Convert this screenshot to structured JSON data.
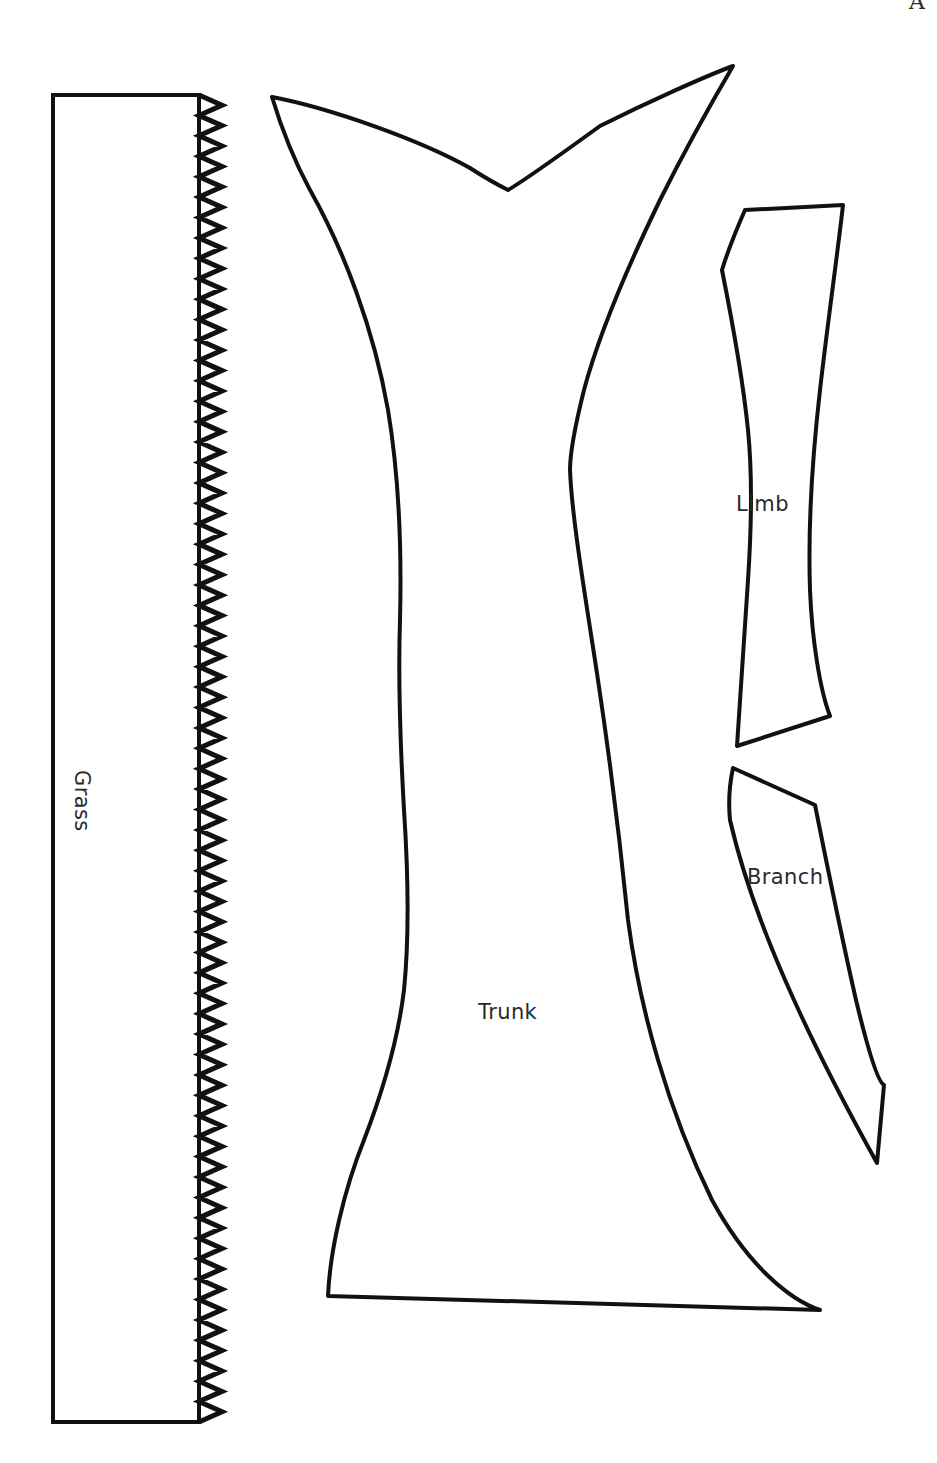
{
  "page": {
    "width": 937,
    "height": 1463,
    "background_color": "#ffffff",
    "ink_color": "#111111",
    "corner_letter": "A"
  },
  "document": {
    "kind": "pattern-template-sheet",
    "subject": "tree",
    "line_color": "#111111",
    "fill": "none"
  },
  "pieces": [
    {
      "id": "grass",
      "label": "Grass",
      "label_rotation_deg": 90,
      "description": "tall narrow rectangle with sawtooth zigzag along its right edge",
      "bbox": [
        53,
        95,
        222,
        1422
      ]
    },
    {
      "id": "trunk",
      "label": "Trunk",
      "label_rotation_deg": 0,
      "description": "wide tapering trunk with a V crotch at the top and a flared base",
      "bbox": [
        272,
        66,
        822,
        1312
      ]
    },
    {
      "id": "limb",
      "label": "Limb",
      "label_rotation_deg": 0,
      "description": "long gently S-curved tapered strip",
      "bbox": [
        735,
        204,
        848,
        747
      ]
    },
    {
      "id": "branch",
      "label": "Branch",
      "label_rotation_deg": 0,
      "description": "slender crescent sliver tapering to a point at the bottom",
      "bbox": [
        730,
        766,
        884,
        1163
      ]
    }
  ],
  "shapes": {
    "grass_body": "M 53 95 L 199 95 L 199 1422 L 53 1422 Z",
    "grass_zigzag": {
      "x_left": 199,
      "x_right": 222,
      "y_start": 95,
      "y_end": 1422,
      "period": 20.4,
      "teeth": 65
    },
    "trunk": "M 272 97 C 330 108 420 140 470 168 C 487 179 500 186 508 190 C 520 183 560 155 600 126 C 650 101 706 76 733 66 C 716 95 684 152 660 200 C 628 266 600 330 584 390 C 574 430 570 455 570 470 C 572 520 586 600 598 680 C 610 760 620 840 628 920 C 640 1010 668 1110 712 1200 C 748 1266 790 1300 820 1310 L 328 1296 C 330 1250 344 1190 364 1140 C 384 1088 398 1040 404 990 C 410 930 408 870 404 810 C 400 740 398 680 400 620 C 402 540 398 470 388 410 C 374 330 344 250 310 190 C 296 164 282 130 272 97 Z",
    "limb": "M 745 210 L 843 205 C 838 250 828 320 820 390 C 812 460 808 530 810 590 C 812 640 820 690 830 716 L 737 746 C 740 700 744 640 748 580 C 752 520 752 470 748 430 C 742 370 730 310 722 270 C 728 250 738 226 745 210 Z",
    "branch": "M 733 768 L 815 805 C 826 860 840 930 856 1000 C 868 1050 878 1082 884 1085 L 877 1163 C 852 1118 822 1062 794 1000 C 764 934 742 872 730 820 C 728 800 730 782 733 768 Z"
  },
  "labels": {
    "trunk": "Trunk",
    "limb": "Limb",
    "branch": "Branch",
    "grass": "Grass"
  }
}
